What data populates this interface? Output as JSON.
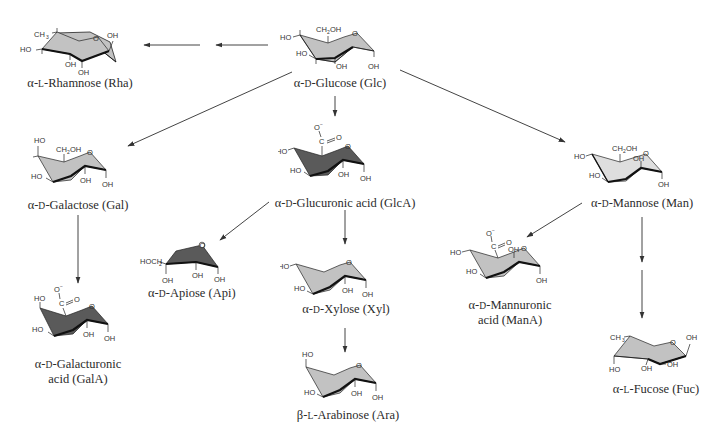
{
  "colors": {
    "ring_light": "#c2c2c2",
    "ring_dark": "#5a5a5a",
    "ring_mannose": "#dedede",
    "stroke": "#222222",
    "arrow": "#444444",
    "text": "#2b2b2b"
  },
  "nodes": {
    "rha": {
      "greek": "α-",
      "config": "L",
      "name": "-Rhamnose (Rha)",
      "shade": "light"
    },
    "glc": {
      "greek": "α-",
      "config": "D",
      "name": "-Glucose (Glc)",
      "shade": "light"
    },
    "gal": {
      "greek": "α-",
      "config": "D",
      "name": "-Galactose (Gal)",
      "shade": "light"
    },
    "glca": {
      "greek": "α-",
      "config": "D",
      "name": "-Glucuronic acid (GlcA)",
      "shade": "dark"
    },
    "man": {
      "greek": "α-",
      "config": "D",
      "name": "-Mannose (Man)",
      "shade": "lighter"
    },
    "api": {
      "greek": "α-",
      "config": "D",
      "name": "-Apiose (Api)",
      "shade": "dark"
    },
    "xyl": {
      "greek": "α-",
      "config": "D",
      "name": "-Xylose (Xyl)",
      "shade": "light"
    },
    "mana": {
      "greek": "α-",
      "config": "D",
      "name_line1": "-Mannuronic",
      "name_line2": "acid (ManA)",
      "shade": "light"
    },
    "gala": {
      "greek": "α-",
      "config": "D",
      "name_line1": "-Galacturonic",
      "name_line2": "acid (GalA)",
      "shade": "dark"
    },
    "ara": {
      "greek": "β-",
      "config": "L",
      "name": "-Arabinose (Ara)",
      "shade": "light"
    },
    "fuc": {
      "greek": "α-",
      "config": "L",
      "name": "-Fucose (Fuc)",
      "shade": "light"
    }
  },
  "atoms": {
    "oh": "OH",
    "ho": "HO",
    "o": "O",
    "ch2oh": "CH",
    "ch2oh_sub": "2",
    "ch2oh_tail": "OH",
    "ch3": "CH",
    "ch3_sub": "3",
    "hoch2": "HOCH",
    "hoch2_sub": "2",
    "c": "C",
    "o_minus": "O",
    "minus": "−"
  },
  "edges": [
    {
      "from": "glc",
      "to": "rha",
      "style": "two-step"
    },
    {
      "from": "glc",
      "to": "gal"
    },
    {
      "from": "glc",
      "to": "glca"
    },
    {
      "from": "glc",
      "to": "man"
    },
    {
      "from": "gal",
      "to": "gala"
    },
    {
      "from": "glca",
      "to": "api"
    },
    {
      "from": "glca",
      "to": "xyl"
    },
    {
      "from": "xyl",
      "to": "ara"
    },
    {
      "from": "man",
      "to": "mana"
    },
    {
      "from": "man",
      "to": "fuc",
      "style": "two-step"
    }
  ]
}
